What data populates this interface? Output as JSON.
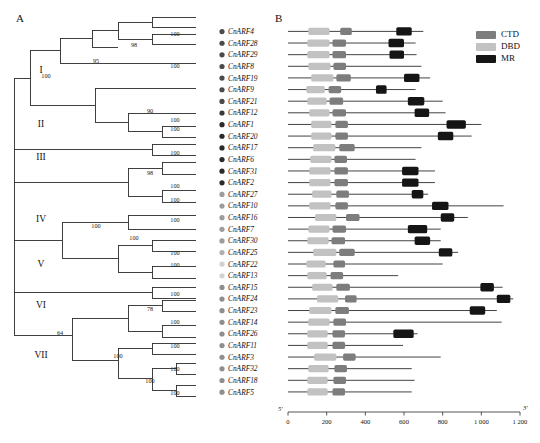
{
  "figure": {
    "panel_a_letter": "A",
    "panel_b_letter": "B"
  },
  "legend": {
    "items": [
      {
        "label": "CTD",
        "color": "#7d7d7d"
      },
      {
        "label": "DBD",
        "color": "#c2c2c2"
      },
      {
        "label": "MR",
        "color": "#151515"
      }
    ]
  },
  "axis": {
    "five_prime": "5'",
    "three_prime": "3'",
    "ticks": [
      "0",
      "200",
      "400",
      "600",
      "800",
      "1 000",
      "1 200"
    ],
    "tick_values": [
      0,
      200,
      400,
      600,
      800,
      1000,
      1200
    ],
    "min": 0,
    "max": 1200
  },
  "groups": [
    {
      "label": "I",
      "y": 73
    },
    {
      "label": "II",
      "y": 127
    },
    {
      "label": "III",
      "y": 160
    },
    {
      "label": "IV",
      "y": 222
    },
    {
      "label": "V",
      "y": 267
    },
    {
      "label": "VI",
      "y": 308
    },
    {
      "label": "VII",
      "y": 358
    }
  ],
  "bootstrap_labels": [
    {
      "value": "100",
      "x": 175,
      "y": 36
    },
    {
      "value": "98",
      "x": 134,
      "y": 47
    },
    {
      "value": "95",
      "x": 96,
      "y": 63
    },
    {
      "value": "100",
      "x": 175,
      "y": 68
    },
    {
      "value": "100",
      "x": 46,
      "y": 78
    },
    {
      "value": "90",
      "x": 150,
      "y": 113
    },
    {
      "value": "100",
      "x": 175,
      "y": 122
    },
    {
      "value": "100",
      "x": 175,
      "y": 131
    },
    {
      "value": "100",
      "x": 175,
      "y": 155
    },
    {
      "value": "98",
      "x": 150,
      "y": 175
    },
    {
      "value": "100",
      "x": 175,
      "y": 188
    },
    {
      "value": "100",
      "x": 175,
      "y": 202
    },
    {
      "value": "100",
      "x": 96,
      "y": 228
    },
    {
      "value": "100",
      "x": 175,
      "y": 222
    },
    {
      "value": "100",
      "x": 134,
      "y": 240
    },
    {
      "value": "100",
      "x": 175,
      "y": 255
    },
    {
      "value": "100",
      "x": 175,
      "y": 267
    },
    {
      "value": "100",
      "x": 175,
      "y": 296
    },
    {
      "value": "78",
      "x": 150,
      "y": 311
    },
    {
      "value": "100",
      "x": 175,
      "y": 324
    },
    {
      "value": "64",
      "x": 60,
      "y": 335
    },
    {
      "value": "100",
      "x": 175,
      "y": 348
    },
    {
      "value": "100",
      "x": 118,
      "y": 358
    },
    {
      "value": "100",
      "x": 175,
      "y": 371
    },
    {
      "value": "100",
      "x": 150,
      "y": 383
    },
    {
      "value": "100",
      "x": 175,
      "y": 395
    }
  ],
  "genes": [
    {
      "name": "CnARF4",
      "group": "I",
      "dot": "#4a4a4a",
      "length": 700,
      "dbd": [
        105,
        215
      ],
      "ctd": [
        270,
        330
      ],
      "mr": [
        560,
        640
      ]
    },
    {
      "name": "CnARF28",
      "group": "I",
      "dot": "#4a4a4a",
      "length": 660,
      "dbd": [
        100,
        215
      ],
      "ctd": [
        230,
        300
      ],
      "mr": [
        520,
        600
      ]
    },
    {
      "name": "CnARF29",
      "group": "I",
      "dot": "#4a4a4a",
      "length": 665,
      "dbd": [
        100,
        215
      ],
      "ctd": [
        230,
        300
      ],
      "mr": [
        525,
        600
      ]
    },
    {
      "name": "CnARF8",
      "group": "I",
      "dot": "#4a4a4a",
      "length": 690,
      "dbd": [
        105,
        220
      ],
      "ctd": [
        235,
        300
      ],
      "mr": null
    },
    {
      "name": "CnARF19",
      "group": "I",
      "dot": "#4a4a4a",
      "length": 735,
      "dbd": [
        120,
        235
      ],
      "ctd": [
        250,
        325
      ],
      "mr": [
        600,
        680
      ]
    },
    {
      "name": "CnARF9",
      "group": "I",
      "dot": "#4a4a4a",
      "length": 660,
      "dbd": [
        95,
        190
      ],
      "ctd": [
        210,
        275
      ],
      "mr": [
        455,
        510
      ]
    },
    {
      "name": "CnARF21",
      "group": "I",
      "dot": "#4a4a4a",
      "length": 800,
      "dbd": [
        100,
        200
      ],
      "ctd": [
        215,
        285
      ],
      "mr": [
        620,
        705
      ]
    },
    {
      "name": "CnARF12",
      "group": "I",
      "dot": "#3a3a3a",
      "length": 815,
      "dbd": [
        110,
        215
      ],
      "ctd": [
        230,
        300
      ],
      "mr": [
        655,
        730
      ]
    },
    {
      "name": "CnARF1",
      "group": "II",
      "dot": "#2a2a2a",
      "length": 1000,
      "dbd": [
        120,
        225
      ],
      "ctd": [
        245,
        310
      ],
      "mr": [
        820,
        920
      ]
    },
    {
      "name": "CnARF20",
      "group": "II",
      "dot": "#2a2a2a",
      "length": 950,
      "dbd": [
        120,
        225
      ],
      "ctd": [
        245,
        310
      ],
      "mr": [
        775,
        855
      ]
    },
    {
      "name": "CnARF17",
      "group": "III",
      "dot": "#2a2a2a",
      "length": 690,
      "dbd": [
        130,
        245
      ],
      "ctd": [
        265,
        345
      ],
      "mr": null
    },
    {
      "name": "CnARF6",
      "group": "III",
      "dot": "#2a2a2a",
      "length": 660,
      "dbd": [
        115,
        225
      ],
      "ctd": [
        240,
        305
      ],
      "mr": null
    },
    {
      "name": "CnARF31",
      "group": "III",
      "dot": "#2a2a2a",
      "length": 760,
      "dbd": [
        110,
        220
      ],
      "ctd": [
        240,
        310
      ],
      "mr": [
        590,
        675
      ]
    },
    {
      "name": "CnARF2",
      "group": "III",
      "dot": "#2a2a2a",
      "length": 760,
      "dbd": [
        110,
        220
      ],
      "ctd": [
        240,
        310
      ],
      "mr": [
        590,
        675
      ]
    },
    {
      "name": "CnARF27",
      "group": "IV",
      "dot": "#9c9c9c",
      "length": 725,
      "dbd": [
        125,
        225
      ],
      "ctd": [
        250,
        315
      ],
      "mr": [
        640,
        700
      ]
    },
    {
      "name": "CnARF10",
      "group": "IV",
      "dot": "#9c9c9c",
      "length": 1115,
      "dbd": [
        110,
        220
      ],
      "ctd": [
        245,
        310
      ],
      "mr": [
        745,
        830
      ]
    },
    {
      "name": "CnARF16",
      "group": "IV",
      "dot": "#9c9c9c",
      "length": 930,
      "dbd": [
        140,
        250
      ],
      "ctd": [
        300,
        370
      ],
      "mr": [
        790,
        860
      ]
    },
    {
      "name": "CnARF7",
      "group": "IV",
      "dot": "#9c9c9c",
      "length": 790,
      "dbd": [
        105,
        215
      ],
      "ctd": [
        230,
        300
      ],
      "mr": [
        620,
        720
      ]
    },
    {
      "name": "CnARF30",
      "group": "IV",
      "dot": "#9c9c9c",
      "length": 790,
      "dbd": [
        100,
        210
      ],
      "ctd": [
        225,
        295
      ],
      "mr": [
        655,
        735
      ]
    },
    {
      "name": "CnARF25",
      "group": "IV",
      "dot": "#b0b0b0",
      "length": 880,
      "dbd": [
        130,
        250
      ],
      "ctd": [
        265,
        345
      ],
      "mr": [
        780,
        850
      ]
    },
    {
      "name": "CnARF22",
      "group": "V",
      "dot": "#d2d2d2",
      "length": 800,
      "dbd": [
        95,
        195
      ],
      "ctd": [
        235,
        295
      ],
      "mr": null
    },
    {
      "name": "CnARF13",
      "group": "V",
      "dot": "#d2d2d2",
      "length": 570,
      "dbd": [
        100,
        200
      ],
      "ctd": [
        220,
        285
      ],
      "mr": null
    },
    {
      "name": "CnARF15",
      "group": "VI",
      "dot": "#8e8e8e",
      "length": 1110,
      "dbd": [
        125,
        230
      ],
      "ctd": [
        250,
        320
      ],
      "mr": [
        995,
        1065
      ]
    },
    {
      "name": "CnARF24",
      "group": "VI",
      "dot": "#8e8e8e",
      "length": 1165,
      "dbd": [
        150,
        260
      ],
      "ctd": [
        295,
        355
      ],
      "mr": [
        1080,
        1150
      ]
    },
    {
      "name": "CnARF23",
      "group": "VI",
      "dot": "#8e8e8e",
      "length": 1080,
      "dbd": [
        110,
        225
      ],
      "ctd": [
        245,
        315
      ],
      "mr": [
        940,
        1020
      ]
    },
    {
      "name": "CnARF14",
      "group": "VI",
      "dot": "#8e8e8e",
      "length": 1105,
      "dbd": [
        105,
        215
      ],
      "ctd": [
        235,
        300
      ],
      "mr": null
    },
    {
      "name": "CnARF26",
      "group": "VII",
      "dot": "#8e8e8e",
      "length": 670,
      "dbd": [
        100,
        205
      ],
      "ctd": [
        230,
        295
      ],
      "mr": [
        545,
        650
      ]
    },
    {
      "name": "CnARF11",
      "group": "VII",
      "dot": "#8e8e8e",
      "length": 595,
      "dbd": [
        100,
        205
      ],
      "ctd": [
        230,
        295
      ],
      "mr": null
    },
    {
      "name": "CnARF3",
      "group": "VII",
      "dot": "#8e8e8e",
      "length": 790,
      "dbd": [
        135,
        250
      ],
      "ctd": [
        285,
        350
      ],
      "mr": null
    },
    {
      "name": "CnARF32",
      "group": "VII",
      "dot": "#8e8e8e",
      "length": 640,
      "dbd": [
        105,
        210
      ],
      "ctd": [
        240,
        305
      ],
      "mr": null
    },
    {
      "name": "CnARF18",
      "group": "VII",
      "dot": "#8e8e8e",
      "length": 655,
      "dbd": [
        100,
        205
      ],
      "ctd": [
        235,
        300
      ],
      "mr": null
    },
    {
      "name": "CnARF5",
      "group": "VII",
      "dot": "#8e8e8e",
      "length": 640,
      "dbd": [
        100,
        205
      ],
      "ctd": [
        230,
        295
      ],
      "mr": null
    }
  ],
  "tree_edges": [
    [
      14,
      78,
      14,
      335
    ],
    [
      14,
      78,
      30,
      78
    ],
    [
      30,
      50,
      30,
      105
    ],
    [
      30,
      50,
      60,
      50
    ],
    [
      30,
      105,
      95,
      105
    ],
    [
      60,
      38,
      60,
      63
    ],
    [
      60,
      38,
      92,
      38
    ],
    [
      60,
      63,
      92,
      63
    ],
    [
      92,
      38,
      92,
      38
    ],
    [
      92,
      30,
      92,
      47
    ],
    [
      92,
      30,
      118,
      30
    ],
    [
      92,
      47,
      118,
      47
    ],
    [
      118,
      22,
      118,
      39
    ],
    [
      118,
      22,
      152,
      22
    ],
    [
      118,
      39,
      152,
      39
    ],
    [
      152,
      17,
      152,
      27
    ],
    [
      152,
      17,
      196,
      17
    ],
    [
      152,
      27,
      196,
      27
    ],
    [
      152,
      34,
      152,
      44
    ],
    [
      152,
      34,
      196,
      34
    ],
    [
      152,
      44,
      196,
      44
    ],
    [
      92,
      63,
      196,
      63
    ],
    [
      95,
      88,
      95,
      122
    ],
    [
      95,
      88,
      196,
      88
    ],
    [
      95,
      122,
      128,
      122
    ],
    [
      128,
      113,
      128,
      131
    ],
    [
      128,
      113,
      196,
      113
    ],
    [
      128,
      131,
      162,
      131
    ],
    [
      162,
      126,
      162,
      137
    ],
    [
      162,
      126,
      196,
      126
    ],
    [
      162,
      137,
      196,
      137
    ],
    [
      14,
      149,
      152,
      149
    ],
    [
      152,
      144,
      152,
      155
    ],
    [
      152,
      144,
      196,
      144
    ],
    [
      152,
      155,
      196,
      155
    ],
    [
      14,
      182,
      128,
      182
    ],
    [
      128,
      168,
      128,
      196
    ],
    [
      128,
      168,
      162,
      168
    ],
    [
      128,
      196,
      162,
      196
    ],
    [
      162,
      162,
      162,
      174
    ],
    [
      162,
      162,
      196,
      162
    ],
    [
      162,
      174,
      196,
      174
    ],
    [
      162,
      190,
      162,
      202
    ],
    [
      162,
      190,
      196,
      190
    ],
    [
      162,
      202,
      196,
      202
    ],
    [
      14,
      240,
      62,
      240
    ],
    [
      62,
      222,
      62,
      258
    ],
    [
      62,
      222,
      128,
      222
    ],
    [
      128,
      215,
      128,
      229
    ],
    [
      128,
      215,
      196,
      215
    ],
    [
      128,
      229,
      196,
      229
    ],
    [
      62,
      258,
      118,
      258
    ],
    [
      118,
      245,
      118,
      272
    ],
    [
      118,
      245,
      152,
      245
    ],
    [
      152,
      240,
      152,
      251
    ],
    [
      152,
      240,
      196,
      240
    ],
    [
      152,
      251,
      196,
      251
    ],
    [
      118,
      272,
      152,
      272
    ],
    [
      152,
      266,
      152,
      278
    ],
    [
      152,
      266,
      196,
      266
    ],
    [
      152,
      278,
      196,
      278
    ],
    [
      14,
      292,
      152,
      292
    ],
    [
      152,
      287,
      152,
      298
    ],
    [
      152,
      287,
      196,
      287
    ],
    [
      152,
      298,
      196,
      298
    ],
    [
      14,
      335,
      72,
      335
    ],
    [
      72,
      318,
      72,
      360
    ],
    [
      72,
      318,
      128,
      318
    ],
    [
      128,
      305,
      128,
      331
    ],
    [
      128,
      305,
      162,
      305
    ],
    [
      162,
      300,
      162,
      311
    ],
    [
      162,
      300,
      196,
      300
    ],
    [
      162,
      311,
      196,
      311
    ],
    [
      128,
      331,
      162,
      331
    ],
    [
      162,
      325,
      162,
      337
    ],
    [
      162,
      325,
      196,
      325
    ],
    [
      162,
      337,
      196,
      337
    ],
    [
      72,
      360,
      118,
      360
    ],
    [
      118,
      348,
      118,
      378
    ],
    [
      118,
      348,
      152,
      348
    ],
    [
      152,
      343,
      152,
      354
    ],
    [
      152,
      343,
      196,
      343
    ],
    [
      152,
      354,
      196,
      354
    ],
    [
      118,
      378,
      152,
      378
    ],
    [
      152,
      368,
      152,
      390
    ],
    [
      152,
      368,
      176,
      368
    ],
    [
      176,
      363,
      176,
      374
    ],
    [
      176,
      363,
      196,
      363
    ],
    [
      176,
      374,
      196,
      374
    ],
    [
      152,
      390,
      176,
      390
    ],
    [
      176,
      385,
      176,
      396
    ],
    [
      176,
      385,
      196,
      385
    ],
    [
      176,
      396,
      196,
      396
    ]
  ]
}
